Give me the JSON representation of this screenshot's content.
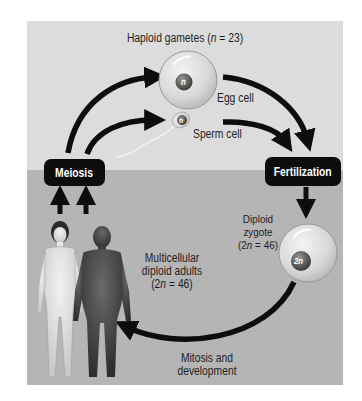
{
  "diagram": {
    "title_label": "Haploid gametes (n = 23)",
    "title_parts": {
      "prefix": "Haploid gametes (",
      "var": "n",
      "suffix": " = 23)"
    },
    "stages": {
      "meiosis": "Meiosis",
      "fertilization": "Fertilization"
    },
    "cells": {
      "egg": {
        "label": "Egg cell",
        "nucleus": "n"
      },
      "sperm": {
        "label": "Sperm cell",
        "nucleus": "n"
      },
      "zygote": {
        "label_line1": "Diploid",
        "label_line2": "zygote",
        "label_line3_prefix": "(2",
        "label_line3_var": "n",
        "label_line3_suffix": " = 46)",
        "nucleus": "2n"
      }
    },
    "adults": {
      "label_line1": "Multicellular",
      "label_line2": "diploid adults",
      "label_line3_prefix": "(2",
      "label_line3_var": "n",
      "label_line3_suffix": " = 46)"
    },
    "process": {
      "label_line1": "Mitosis and",
      "label_line2": "development"
    },
    "colors": {
      "upper_background": "#dcdcdc",
      "lower_background": "#b5b5b5",
      "arrow": "#0d0d0d",
      "stage_box": "#0d0d0d",
      "stage_text": "#ffffff"
    }
  }
}
